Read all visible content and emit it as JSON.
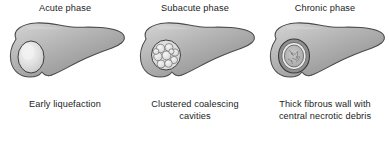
{
  "figure": {
    "background_color": "#ffffff",
    "text_color": "#1c1c1c",
    "panel_count": 3
  },
  "palette": {
    "liver_light": "#c9c9c9",
    "liver_mid": "#a8a8a8",
    "liver_dark": "#8d8d8d",
    "liver_outline": "#4a4a4a",
    "lesion_pale": "#e8e8e8",
    "lesion_highlight": "#f4f4f4",
    "lesion_outline": "#3d3d3d",
    "debris_gray": "#9a9a9a"
  },
  "panels": [
    {
      "id": "acute",
      "heading": "Acute phase",
      "caption_line1": "Early liquefaction",
      "caption_line2": "",
      "lesion_name": "solitary-liquefaction-lesion"
    },
    {
      "id": "subacute",
      "heading": "Subacute phase",
      "caption_line1": "Clustered coalescing",
      "caption_line2": "cavities",
      "lesion_name": "clustered-cavities-lesion"
    },
    {
      "id": "chronic",
      "heading": "Chronic phase",
      "caption_line1": "Thick fibrous wall with",
      "caption_line2": "central necrotic debris",
      "lesion_name": "fibrous-wall-necrotic-lesion"
    }
  ]
}
